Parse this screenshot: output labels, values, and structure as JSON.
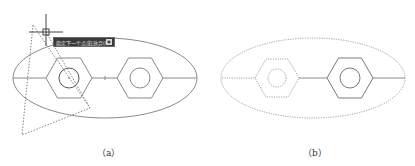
{
  "figure": {
    "panels": [
      {
        "id": "a",
        "caption": "（a）",
        "ellipse": {
          "cx": 105,
          "cy": 78,
          "rx": 92,
          "ry": 40,
          "style": "solid"
        },
        "rings": [
          {
            "cx": 69,
            "cy": 78,
            "r": 23,
            "inner_r": 10,
            "style": "solid",
            "selected": true
          },
          {
            "cx": 140,
            "cy": 78,
            "r": 23,
            "inner_r": 10,
            "style": "solid"
          }
        ],
        "crosshair": {
          "x": 46,
          "y": 32
        },
        "selection_triangle": "33,25 22,135 90,108",
        "tooltip": {
          "text": "指定下一个点或[放弃(U)]",
          "key": "▣"
        }
      },
      {
        "id": "b",
        "caption": "（b）",
        "ellipse": {
          "cx": 313,
          "cy": 78,
          "rx": 92,
          "ry": 40,
          "style": "dashed"
        },
        "rings": [
          {
            "cx": 277,
            "cy": 78,
            "r": 23,
            "inner_r": 9,
            "style": "dashed"
          },
          {
            "cx": 350,
            "cy": 78,
            "r": 23,
            "inner_r": 10,
            "style": "solid"
          }
        ]
      }
    ],
    "colors": {
      "line": "#8a8a8a",
      "dashed": "#9a9a9a",
      "tooltip_bg": "#3a3a3a"
    }
  }
}
